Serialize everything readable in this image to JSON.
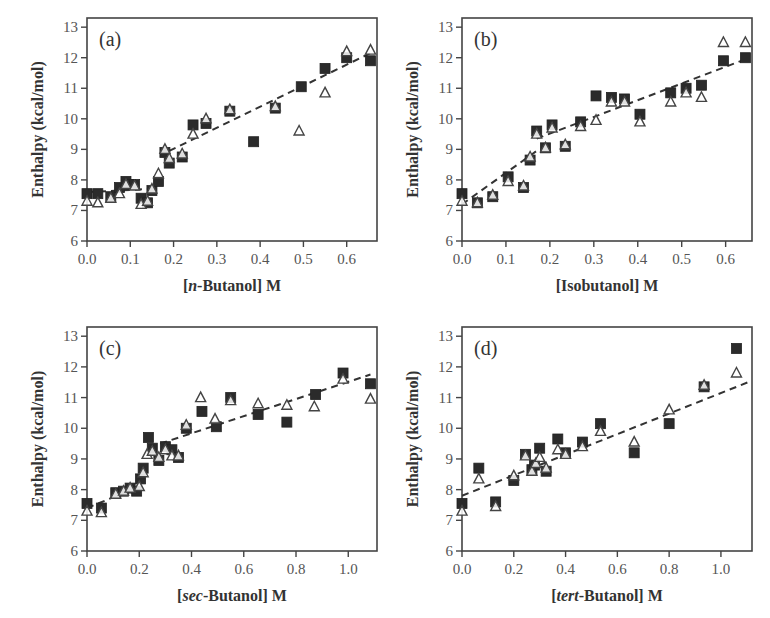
{
  "figure": {
    "marker_legend": {
      "filled_square": "series 1",
      "open_triangle": "series 2"
    },
    "colors": {
      "filled": "#2b2b2b",
      "open": "#444444",
      "fit": "#333333",
      "frame": "#444444"
    }
  },
  "chart_data": [
    {
      "type": "scatter",
      "panel_label": "(a)",
      "xlabel_prefix": "[",
      "xlabel_italic": "n",
      "xlabel_suffix": "-Butanol] M",
      "xlabel": "[n-Butanol] M",
      "ylabel": "Enthalpy (kcal/mol)",
      "xlim": [
        0.0,
        0.67
      ],
      "ylim": [
        6,
        13.3
      ],
      "xticks": [
        0.0,
        0.1,
        0.2,
        0.3,
        0.4,
        0.5,
        0.6
      ],
      "xtick_labels": [
        "0.0",
        "0.1",
        "0.2",
        "0.3",
        "0.4",
        "0.5",
        "0.6"
      ],
      "yticks": [
        6,
        7,
        8,
        9,
        10,
        11,
        12,
        13
      ],
      "series": [
        {
          "name": "filled squares",
          "marker": "square-filled",
          "x": [
            0.0,
            0.025,
            0.055,
            0.075,
            0.09,
            0.1,
            0.11,
            0.125,
            0.14,
            0.15,
            0.165,
            0.18,
            0.19,
            0.22,
            0.245,
            0.275,
            0.33,
            0.385,
            0.435,
            0.495,
            0.55,
            0.6,
            0.655
          ],
          "y": [
            7.55,
            7.55,
            7.45,
            7.75,
            7.95,
            7.85,
            7.85,
            7.4,
            7.25,
            7.65,
            7.95,
            8.9,
            8.55,
            8.75,
            9.8,
            9.85,
            10.25,
            9.25,
            10.35,
            11.05,
            11.65,
            12.0,
            11.9
          ]
        },
        {
          "name": "open triangles",
          "marker": "triangle-open",
          "x": [
            0.0,
            0.025,
            0.055,
            0.075,
            0.09,
            0.11,
            0.125,
            0.14,
            0.15,
            0.165,
            0.18,
            0.19,
            0.22,
            0.245,
            0.275,
            0.33,
            0.435,
            0.49,
            0.55,
            0.6,
            0.655
          ],
          "y": [
            7.3,
            7.25,
            7.4,
            7.55,
            7.85,
            7.8,
            7.2,
            7.3,
            7.7,
            8.2,
            9.0,
            8.7,
            8.85,
            9.5,
            10.0,
            10.3,
            10.4,
            9.6,
            10.85,
            12.2,
            12.25
          ]
        },
        {
          "name": "fit segment 1",
          "type": "line",
          "style": "dashed",
          "x": [
            0.0,
            0.14
          ],
          "y": [
            7.6,
            7.7
          ]
        },
        {
          "name": "fit segment 2",
          "type": "line",
          "style": "dashed",
          "x": [
            0.19,
            0.655
          ],
          "y": [
            8.95,
            12.15
          ]
        }
      ]
    },
    {
      "type": "scatter",
      "panel_label": "(b)",
      "xlabel_prefix": "[Isobutanol] M",
      "xlabel_italic": "",
      "xlabel_suffix": "",
      "xlabel": "[Isobutanol] M",
      "ylabel": "Enthalpy (kcal/mol)",
      "xlim": [
        0.0,
        0.66
      ],
      "ylim": [
        6,
        13.3
      ],
      "xticks": [
        0.0,
        0.1,
        0.2,
        0.3,
        0.4,
        0.5,
        0.6
      ],
      "xtick_labels": [
        "0.0",
        "0.1",
        "0.2",
        "0.3",
        "0.4",
        "0.5",
        "0.6"
      ],
      "yticks": [
        6,
        7,
        8,
        9,
        10,
        11,
        12,
        13
      ],
      "series": [
        {
          "name": "filled squares",
          "marker": "square-filled",
          "x": [
            0.0,
            0.035,
            0.07,
            0.105,
            0.14,
            0.155,
            0.17,
            0.19,
            0.205,
            0.235,
            0.27,
            0.305,
            0.34,
            0.37,
            0.405,
            0.475,
            0.51,
            0.545,
            0.595,
            0.645
          ],
          "y": [
            7.55,
            7.25,
            7.45,
            8.1,
            7.75,
            8.65,
            9.6,
            9.05,
            9.8,
            9.1,
            9.9,
            10.75,
            10.7,
            10.65,
            10.15,
            10.85,
            11.0,
            11.1,
            11.9,
            12.0
          ]
        },
        {
          "name": "open triangles",
          "marker": "triangle-open",
          "x": [
            0.0,
            0.035,
            0.07,
            0.105,
            0.14,
            0.155,
            0.17,
            0.19,
            0.205,
            0.235,
            0.27,
            0.305,
            0.34,
            0.37,
            0.405,
            0.475,
            0.51,
            0.545,
            0.595,
            0.645
          ],
          "y": [
            7.3,
            7.25,
            7.5,
            7.95,
            7.8,
            8.75,
            9.5,
            9.05,
            9.7,
            9.15,
            9.75,
            9.95,
            10.55,
            10.55,
            9.9,
            10.55,
            10.85,
            10.7,
            12.5,
            12.5
          ]
        },
        {
          "name": "fit segment 1",
          "type": "line",
          "style": "dashed",
          "x": [
            0.0,
            0.17
          ],
          "y": [
            7.2,
            8.95
          ]
        },
        {
          "name": "fit segment 2",
          "type": "line",
          "style": "dashed",
          "x": [
            0.17,
            0.645
          ],
          "y": [
            9.35,
            11.95
          ]
        }
      ]
    },
    {
      "type": "scatter",
      "panel_label": "(c)",
      "xlabel_prefix": "[",
      "xlabel_italic": "sec",
      "xlabel_suffix": "-Butanol] M",
      "xlabel": "[sec-Butanol] M",
      "ylabel": "Enthalpy (kcal/mol)",
      "xlim": [
        0.0,
        1.11
      ],
      "ylim": [
        6,
        13.3
      ],
      "xticks": [
        0.0,
        0.2,
        0.4,
        0.6,
        0.8,
        1.0
      ],
      "xtick_labels": [
        "0.0",
        "0.2",
        "0.4",
        "0.6",
        "0.8",
        "1.0"
      ],
      "yticks": [
        6,
        7,
        8,
        9,
        10,
        11,
        12,
        13
      ],
      "series": [
        {
          "name": "filled squares",
          "marker": "square-filled",
          "x": [
            0.0,
            0.055,
            0.11,
            0.14,
            0.165,
            0.19,
            0.205,
            0.215,
            0.235,
            0.25,
            0.275,
            0.3,
            0.325,
            0.35,
            0.38,
            0.44,
            0.495,
            0.55,
            0.655,
            0.765,
            0.875,
            0.98,
            1.085
          ],
          "y": [
            7.55,
            7.4,
            7.9,
            7.95,
            8.05,
            7.95,
            8.35,
            8.7,
            9.7,
            9.35,
            8.95,
            9.4,
            9.3,
            9.05,
            10.0,
            10.55,
            10.05,
            11.0,
            10.45,
            10.2,
            11.1,
            11.8,
            11.45
          ]
        },
        {
          "name": "open triangles",
          "marker": "triangle-open",
          "x": [
            0.0,
            0.055,
            0.11,
            0.14,
            0.165,
            0.2,
            0.215,
            0.23,
            0.25,
            0.275,
            0.3,
            0.325,
            0.35,
            0.38,
            0.435,
            0.49,
            0.55,
            0.655,
            0.765,
            0.87,
            0.98,
            1.085
          ],
          "y": [
            7.3,
            7.25,
            7.85,
            7.95,
            8.05,
            8.1,
            8.55,
            9.15,
            9.25,
            9.05,
            9.3,
            9.1,
            9.1,
            10.1,
            11.0,
            10.3,
            10.9,
            10.8,
            10.75,
            10.7,
            11.6,
            10.95
          ]
        },
        {
          "name": "fit segment 1",
          "type": "line",
          "style": "dashed",
          "x": [
            0.0,
            0.2
          ],
          "y": [
            7.4,
            8.1
          ]
        },
        {
          "name": "fit segment 2",
          "type": "line",
          "style": "dashed",
          "x": [
            0.28,
            1.085
          ],
          "y": [
            9.5,
            11.75
          ]
        }
      ]
    },
    {
      "type": "scatter",
      "panel_label": "(d)",
      "xlabel_prefix": "[",
      "xlabel_italic": "tert",
      "xlabel_suffix": "-Butanol] M",
      "xlabel": "[tert-Butanol] M",
      "ylabel": "Enthalpy (kcal/mol)",
      "xlim": [
        0.0,
        1.12
      ],
      "ylim": [
        6,
        13.3
      ],
      "xticks": [
        0.0,
        0.2,
        0.4,
        0.6,
        0.8,
        1.0
      ],
      "xtick_labels": [
        "0.0",
        "0.2",
        "0.4",
        "0.6",
        "0.8",
        "1.0"
      ],
      "yticks": [
        6,
        7,
        8,
        9,
        10,
        11,
        12,
        13
      ],
      "series": [
        {
          "name": "filled squares",
          "marker": "square-filled",
          "x": [
            0.0,
            0.065,
            0.13,
            0.2,
            0.245,
            0.27,
            0.28,
            0.3,
            0.325,
            0.37,
            0.4,
            0.465,
            0.535,
            0.665,
            0.8,
            0.935,
            1.06
          ],
          "y": [
            7.55,
            8.7,
            7.6,
            8.3,
            9.15,
            8.65,
            8.8,
            9.35,
            8.6,
            9.65,
            9.2,
            9.55,
            10.15,
            9.2,
            10.15,
            11.35,
            12.6
          ]
        },
        {
          "name": "open triangles",
          "marker": "triangle-open",
          "x": [
            0.0,
            0.065,
            0.13,
            0.2,
            0.245,
            0.27,
            0.285,
            0.3,
            0.325,
            0.37,
            0.4,
            0.465,
            0.535,
            0.665,
            0.8,
            0.935,
            1.06
          ],
          "y": [
            7.3,
            8.35,
            7.45,
            8.45,
            9.1,
            8.6,
            8.85,
            9.05,
            8.7,
            9.3,
            9.15,
            9.4,
            9.9,
            9.55,
            10.6,
            11.4,
            11.8
          ]
        },
        {
          "name": "fit",
          "type": "line",
          "style": "dashed",
          "x": [
            0.0,
            1.12
          ],
          "y": [
            7.8,
            11.55
          ]
        }
      ]
    }
  ]
}
